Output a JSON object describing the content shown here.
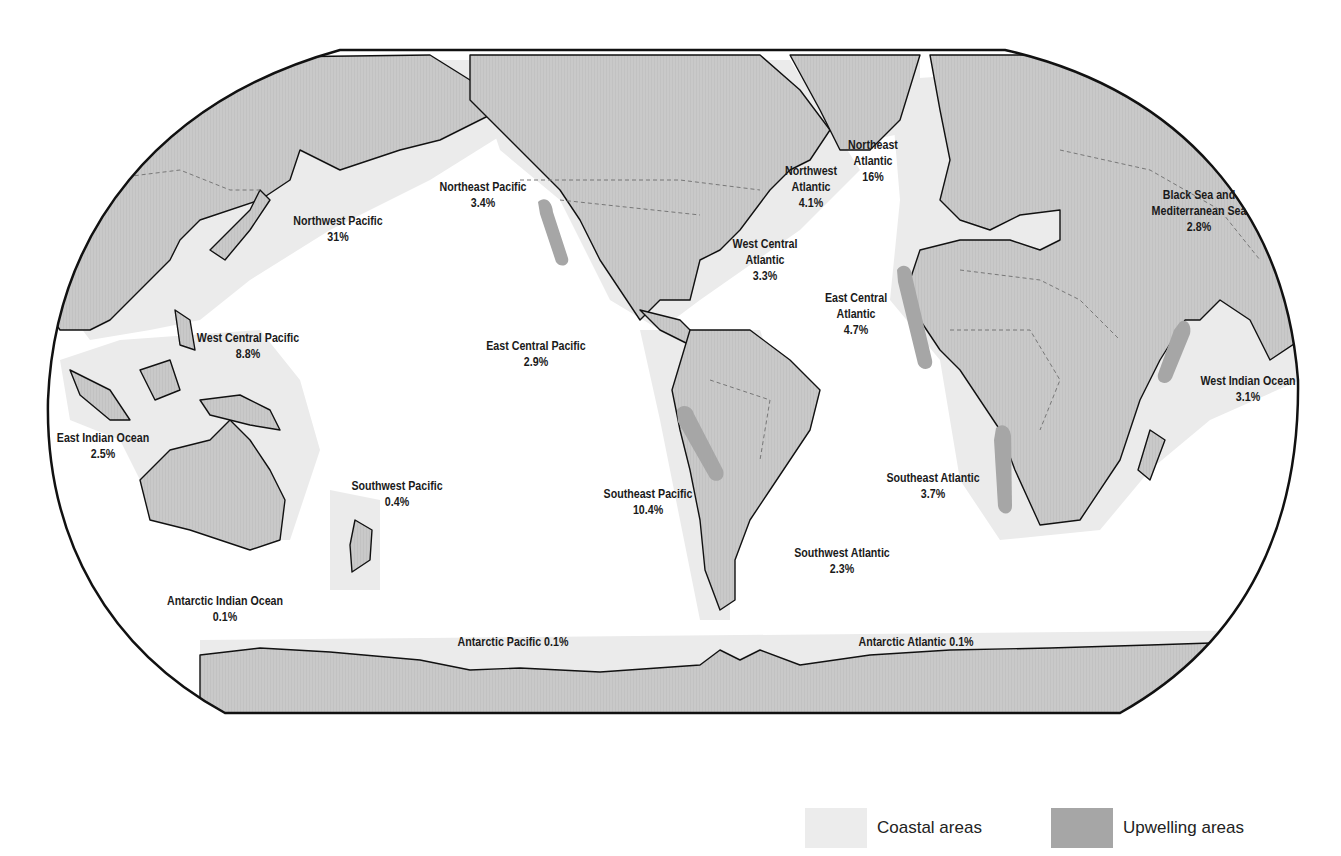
{
  "map": {
    "projection_shape": "Robinson-style world map",
    "colors": {
      "land": "#c8c8c8",
      "coastal": "#ebebeb",
      "upwelling": "#a6a6a6",
      "ocean": "#ffffff",
      "outline": "#111111"
    },
    "regions": [
      {
        "name": "Northwest Pacific",
        "value": "31%",
        "x": 338,
        "y": 213
      },
      {
        "name": "Northeast Pacific",
        "value": "3.4%",
        "x": 483,
        "y": 179
      },
      {
        "name": "Northwest Atlantic",
        "value": "4.1%",
        "x": 811,
        "y": 163,
        "lines": [
          "Northwest",
          "Atlantic"
        ]
      },
      {
        "name": "Northeast Atlantic",
        "value": "16%",
        "x": 873,
        "y": 137,
        "lines": [
          "Northeast",
          "Atlantic"
        ]
      },
      {
        "name": "West Central Atlantic",
        "value": "3.3%",
        "x": 765,
        "y": 236,
        "lines": [
          "West Central",
          "Atlantic"
        ]
      },
      {
        "name": "Black Sea and Mediterranean Sea",
        "value": "2.8%",
        "x": 1199,
        "y": 187,
        "lines": [
          "Black Sea and",
          "Mediterranean Sea"
        ]
      },
      {
        "name": "East Central Atlantic",
        "value": "4.7%",
        "x": 856,
        "y": 290,
        "lines": [
          "East Central",
          "Atlantic"
        ]
      },
      {
        "name": "West Central Pacific",
        "value": "8.8%",
        "x": 248,
        "y": 330
      },
      {
        "name": "East Central Pacific",
        "value": "2.9%",
        "x": 536,
        "y": 338
      },
      {
        "name": "West Indian Ocean",
        "value": "3.1%",
        "x": 1248,
        "y": 373
      },
      {
        "name": "East Indian Ocean",
        "value": "2.5%",
        "x": 103,
        "y": 430
      },
      {
        "name": "Southwest Pacific",
        "value": "0.4%",
        "x": 397,
        "y": 478
      },
      {
        "name": "Southeast Pacific",
        "value": "10.4%",
        "x": 648,
        "y": 486
      },
      {
        "name": "Southeast Atlantic",
        "value": "3.7%",
        "x": 933,
        "y": 470
      },
      {
        "name": "Southwest Atlantic",
        "value": "2.3%",
        "x": 842,
        "y": 545
      },
      {
        "name": "Antarctic Indian Ocean",
        "value": "0.1%",
        "x": 225,
        "y": 593
      },
      {
        "name": "Antarctic Pacific",
        "value": "0.1%",
        "x": 513,
        "y": 634,
        "inline": true
      },
      {
        "name": "Antarctic Atlantic",
        "value": "0.1%",
        "x": 916,
        "y": 634,
        "inline": true
      }
    ]
  },
  "legend": {
    "items": [
      {
        "label": "Coastal areas",
        "color": "#ebebeb"
      },
      {
        "label": "Upwelling areas",
        "color": "#a6a6a6"
      }
    ]
  },
  "labels": {
    "nw_pacific": {
      "l1": "Northwest Pacific",
      "v": "31%"
    },
    "ne_pacific": {
      "l1": "Northeast Pacific",
      "v": "3.4%"
    },
    "nw_atlantic": {
      "l1": "Northwest",
      "l2": "Atlantic",
      "v": "4.1%"
    },
    "ne_atlantic": {
      "l1": "Northeast",
      "l2": "Atlantic",
      "v": "16%"
    },
    "wc_atlantic": {
      "l1": "West Central",
      "l2": "Atlantic",
      "v": "3.3%"
    },
    "med": {
      "l1": "Black Sea and",
      "l2": "Mediterranean Sea",
      "v": "2.8%"
    },
    "ec_atlantic": {
      "l1": "East Central",
      "l2": "Atlantic",
      "v": "4.7%"
    },
    "wc_pacific": {
      "l1": "West Central Pacific",
      "v": "8.8%"
    },
    "ec_pacific": {
      "l1": "East Central Pacific",
      "v": "2.9%"
    },
    "w_indian": {
      "l1": "West Indian Ocean",
      "v": "3.1%"
    },
    "e_indian": {
      "l1": "East Indian Ocean",
      "v": "2.5%"
    },
    "sw_pacific": {
      "l1": "Southwest Pacific",
      "v": "0.4%"
    },
    "se_pacific": {
      "l1": "Southeast Pacific",
      "v": "10.4%"
    },
    "se_atlantic": {
      "l1": "Southeast Atlantic",
      "v": "3.7%"
    },
    "sw_atlantic": {
      "l1": "Southwest Atlantic",
      "v": "2.3%"
    },
    "ant_indian": {
      "l1": "Antarctic Indian Ocean",
      "v": "0.1%"
    },
    "ant_pacific": {
      "l1": "Antarctic Pacific 0.1%"
    },
    "ant_atlantic": {
      "l1": "Antarctic Atlantic 0.1%"
    }
  }
}
